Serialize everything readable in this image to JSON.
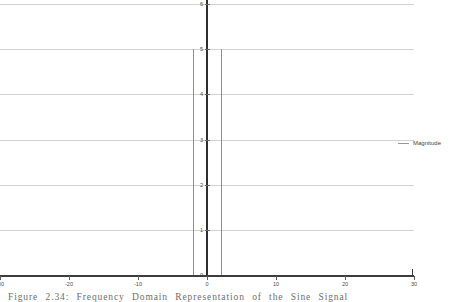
{
  "figure": {
    "caption": "Figure 2.34: Frequency Domain Representation of the Sine Signal"
  },
  "legend": {
    "swatch_name": "magnitude-line-swatch",
    "label": "Magnitude",
    "color": "#9a9a9a",
    "position": "right"
  },
  "axis_colors": {
    "grid": "#d2d2d2",
    "yaxis": "#2e2e2e",
    "xaxis": "#3c3c3c",
    "tick_text": "#4a4a4a"
  },
  "chart_data": {
    "type": "bar",
    "title": "",
    "subtitle": "",
    "xlabel": "",
    "ylabel": "Magnitude",
    "xlim": [
      -30,
      30
    ],
    "ylim": [
      0,
      6
    ],
    "grid": true,
    "xticks": [
      -30,
      -20,
      -10,
      0,
      10,
      20,
      30
    ],
    "xtick_labels": [
      "-30",
      "-20",
      "-10",
      "0",
      "10",
      "20",
      "30"
    ],
    "yticks": [
      0,
      1,
      2,
      3,
      4,
      5,
      6
    ],
    "ytick_labels": [
      "0",
      "1",
      "2",
      "3",
      "4",
      "5",
      "6"
    ],
    "series": [
      {
        "name": "Magnitude",
        "color": "#8f8f8f",
        "x": [
          -2,
          2
        ],
        "values": [
          5,
          5
        ]
      }
    ],
    "annotations": []
  }
}
